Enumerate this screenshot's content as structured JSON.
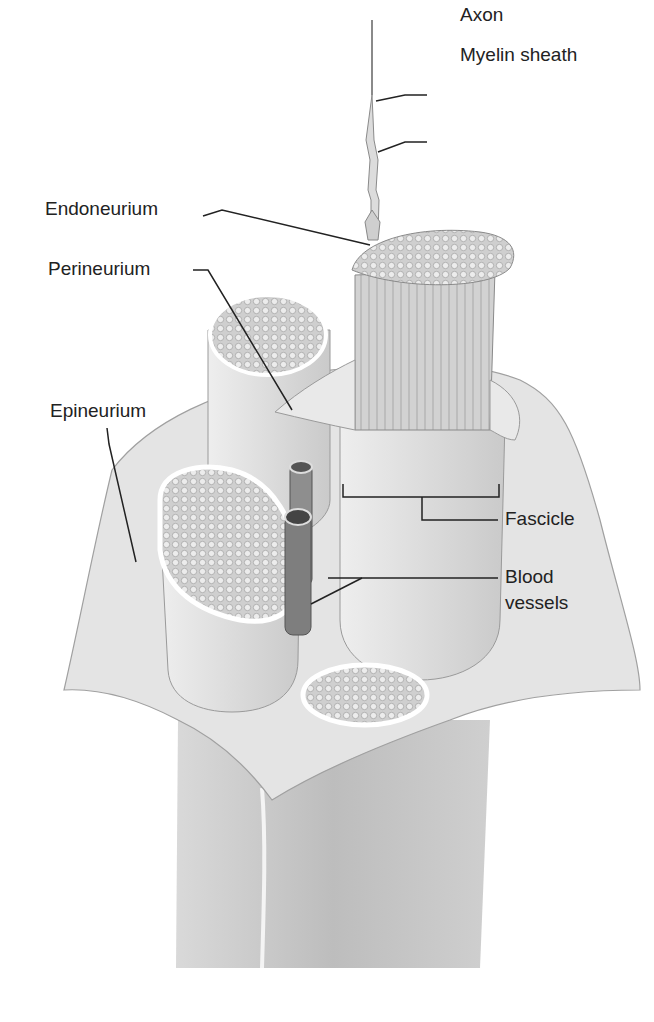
{
  "figure": {
    "labels": {
      "axon": "Axon",
      "myelin_sheath": "Myelin sheath",
      "endoneurium": "Endoneurium",
      "perineurium": "Perineurium",
      "epineurium": "Epineurium",
      "fascicle": "Fascicle",
      "blood_vessels_line1": "Blood",
      "blood_vessels_line2": "vessels"
    }
  }
}
